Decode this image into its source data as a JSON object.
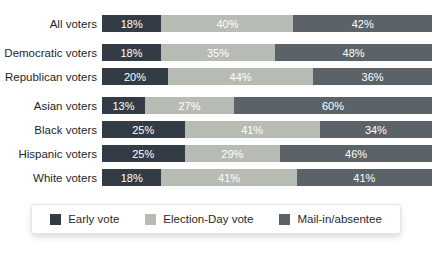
{
  "chart_data": {
    "type": "bar",
    "orientation": "horizontal-stacked",
    "title": "",
    "xlabel": "",
    "ylabel": "",
    "value_suffix": "%",
    "axis_shown": false,
    "grid": false,
    "legend_position": "bottom",
    "categories": [
      "All voters",
      "Democratic voters",
      "Republican voters",
      "Asian voters",
      "Black voters",
      "Hispanic voters",
      "White voters"
    ],
    "group_breaks": [
      1,
      3
    ],
    "series": [
      {
        "name": "Early vote",
        "color": "#333c45",
        "values": [
          18,
          18,
          20,
          13,
          25,
          25,
          18
        ]
      },
      {
        "name": "Election-Day vote",
        "color": "#b6bbb4",
        "values": [
          40,
          35,
          44,
          27,
          41,
          29,
          41
        ]
      },
      {
        "name": "Mail-in/absentee",
        "color": "#5b6368",
        "values": [
          42,
          48,
          36,
          60,
          34,
          46,
          41
        ]
      }
    ]
  }
}
